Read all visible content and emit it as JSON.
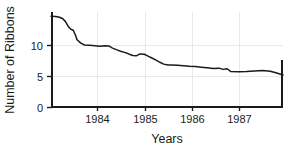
{
  "chart_data": {
    "type": "line",
    "title": "",
    "xlabel": "Years",
    "ylabel": "Number of Ribbons",
    "xlim": [
      1983.45,
      1988.35
    ],
    "ylim": [
      0,
      15.4
    ],
    "grid": true,
    "legend": null,
    "xticks": [
      1984,
      1985,
      1986,
      1987
    ],
    "xticklabels": [
      "1984",
      "1985",
      "1986",
      "1987"
    ],
    "yticks": [
      0,
      5,
      10
    ],
    "yticklabels": [
      "0",
      "5",
      "10"
    ],
    "gridlines_y": [
      5,
      10
    ],
    "gridlines_x": [
      1984,
      1985,
      1986,
      1987
    ],
    "line_color": "#1a1a1a",
    "grid_color": "#e9e9e9",
    "series": [
      {
        "name": "Number of Ribbons",
        "x": [
          1983.45,
          1983.55,
          1983.63,
          1983.7,
          1983.76,
          1983.82,
          1983.87,
          1983.92,
          1983.97,
          1984.0,
          1984.08,
          1984.16,
          1984.25,
          1984.33,
          1984.42,
          1984.5,
          1984.58,
          1984.67,
          1984.75,
          1984.83,
          1984.92,
          1985.0,
          1985.06,
          1985.12,
          1985.18,
          1985.25,
          1985.33,
          1985.42,
          1985.5,
          1985.58,
          1985.67,
          1985.75,
          1985.83,
          1985.92,
          1986.0,
          1986.12,
          1986.25,
          1986.37,
          1986.5,
          1986.62,
          1986.75,
          1986.87,
          1987.0,
          1987.08,
          1987.17,
          1987.25,
          1987.42,
          1987.58,
          1987.75,
          1987.92,
          1988.08,
          1988.2,
          1988.35
        ],
        "y": [
          14.7,
          14.68,
          14.55,
          14.3,
          13.8,
          13.0,
          12.6,
          12.45,
          11.6,
          10.9,
          10.35,
          10.05,
          10.0,
          9.95,
          9.9,
          9.85,
          9.92,
          9.9,
          9.55,
          9.3,
          9.05,
          8.85,
          8.7,
          8.5,
          8.35,
          8.3,
          8.6,
          8.55,
          8.25,
          7.95,
          7.6,
          7.25,
          6.95,
          6.8,
          6.8,
          6.78,
          6.7,
          6.6,
          6.55,
          6.45,
          6.35,
          6.25,
          6.3,
          6.1,
          6.2,
          5.75,
          5.7,
          5.75,
          5.85,
          5.9,
          5.8,
          5.55,
          5.2
        ]
      }
    ]
  },
  "axis": {
    "ylabel_text": "Number of Ribbons",
    "xlabel_text": "Years",
    "ytick_0": "0",
    "ytick_5": "5",
    "ytick_10": "10",
    "xtick_1984": "1984",
    "xtick_1985": "1985",
    "xtick_1986": "1986",
    "xtick_1987": "1987"
  }
}
